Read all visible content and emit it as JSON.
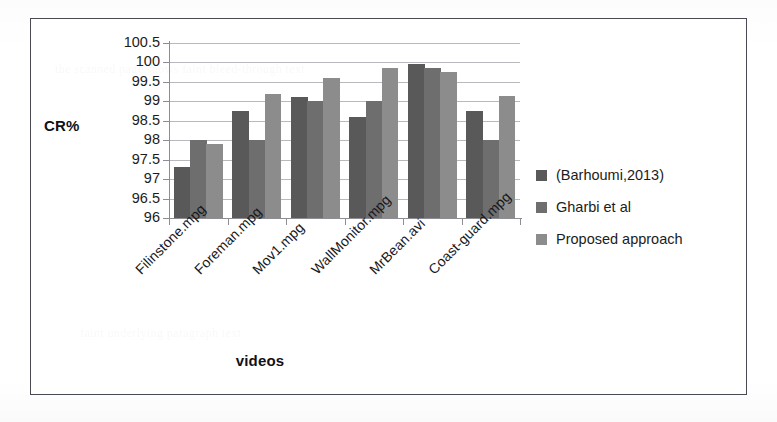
{
  "figure": {
    "frame": true
  },
  "chart_data": {
    "type": "bar",
    "title": "",
    "xlabel": "videos",
    "ylabel": "CR%",
    "ylim": [
      96,
      100.5
    ],
    "ytick_step": 0.5,
    "yticks": [
      "100.5",
      "100",
      "99.5",
      "99",
      "98.5",
      "98",
      "97.5",
      "97",
      "96.5",
      "96"
    ],
    "ytick_values": [
      100.5,
      100,
      99.5,
      99,
      98.5,
      98,
      97.5,
      97,
      96.5,
      96
    ],
    "grid": true,
    "grid_axis": "y",
    "legend_position": "right",
    "categories": [
      "Filinstone.mpg",
      "Foreman.mpg",
      "Mov1.mpg",
      "WallMonitor.mpg",
      "MrBean.avi",
      "Coast-guard.mpg"
    ],
    "series": [
      {
        "name": "(Barhoumi,2013)",
        "color": "#595959",
        "values": [
          97.3,
          98.75,
          99.1,
          98.6,
          99.95,
          98.75
        ]
      },
      {
        "name": "Gharbi et al",
        "color": "#6e6e6e",
        "values": [
          98.0,
          98.0,
          99.0,
          99.0,
          99.85,
          98.0
        ]
      },
      {
        "name": "Proposed approach",
        "color": "#8c8c8c",
        "values": [
          97.9,
          99.2,
          99.6,
          99.85,
          99.75,
          99.15
        ]
      }
    ]
  },
  "artifacts": {
    "ghost_line_1": "the scanned page shows faint bleed-through text",
    "ghost_line_2": "faint underlying paragraph text"
  }
}
